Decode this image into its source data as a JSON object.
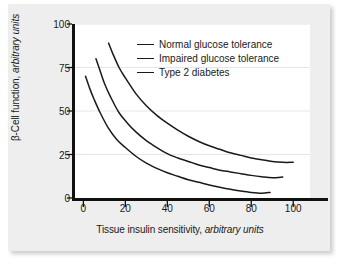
{
  "chart_data": {
    "type": "line",
    "title": "",
    "xlabel": "Tissue insulin sensitivity, arbitrary units",
    "xlabel_plain": "Tissue insulin sensitivity,",
    "xlabel_italic": "arbitrary units",
    "ylabel": "β-Cell function, arbitrary units",
    "ylabel_plain": "β-Cell function,",
    "ylabel_italic": "arbitrary units",
    "xlim": [
      -4,
      108
    ],
    "ylim": [
      0,
      100
    ],
    "xticks": [
      0,
      20,
      40,
      60,
      80,
      100
    ],
    "xtick_labels": [
      "0",
      "20",
      "40",
      "60",
      "80",
      "100"
    ],
    "yticks": [
      0,
      25,
      50,
      75,
      100
    ],
    "ytick_labels": [
      "0",
      "25",
      "50",
      "75",
      "100"
    ],
    "grid": "horizontal-faint",
    "grid_color": "#e6e6e6",
    "line_color": "#1a1a1a",
    "line_width": 1.5,
    "legend_position": "upper-right-inside",
    "series": [
      {
        "name": "Normal glucose tolerance",
        "x": [
          12,
          14,
          17,
          20,
          25,
          30,
          35,
          40,
          45,
          50,
          55,
          60,
          65,
          70,
          75,
          80,
          85,
          90,
          95,
          100
        ],
        "y": [
          89,
          83,
          75,
          69,
          60,
          53,
          47.5,
          43,
          39,
          35.5,
          32.5,
          30,
          28,
          26,
          24.5,
          23,
          22,
          21,
          20.5,
          20.5
        ]
      },
      {
        "name": "Impaired glucose tolerance",
        "x": [
          6,
          8,
          10,
          13,
          17,
          21,
          25,
          30,
          35,
          40,
          45,
          50,
          55,
          60,
          65,
          70,
          75,
          80,
          85,
          90,
          95
        ],
        "y": [
          80,
          73,
          66,
          58,
          49,
          43,
          38,
          33,
          29,
          25.5,
          23,
          21,
          19,
          17.5,
          16,
          15,
          14,
          13,
          12.2,
          11.6,
          12
        ]
      },
      {
        "name": "Type 2 diabetes",
        "x": [
          1,
          3,
          5,
          8,
          12,
          16,
          20,
          25,
          30,
          35,
          40,
          45,
          50,
          55,
          60,
          65,
          70,
          75,
          80,
          85,
          89
        ],
        "y": [
          70,
          63,
          57,
          49,
          40,
          33.5,
          29,
          24,
          20,
          17,
          14.5,
          12.5,
          10.5,
          9,
          7.5,
          6.2,
          5,
          4,
          3.2,
          2.8,
          3.2
        ]
      }
    ],
    "legend": [
      {
        "label": "Normal glucose tolerance"
      },
      {
        "label": "Impaired glucose tolerance"
      },
      {
        "label": "Type 2 diabetes"
      }
    ]
  }
}
